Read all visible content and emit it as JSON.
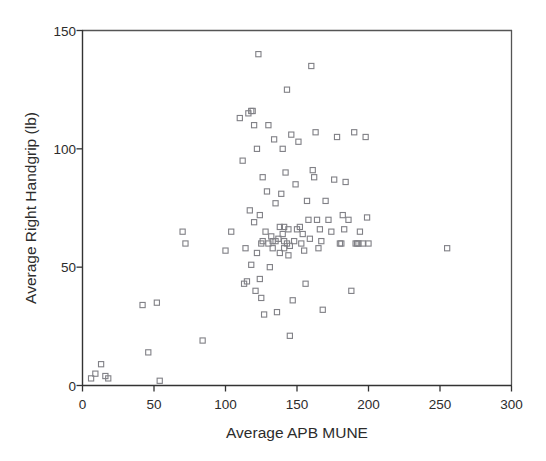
{
  "chart_data": {
    "type": "scatter",
    "title": "",
    "xlabel": "Average APB MUNE",
    "ylabel": "Average Right Handgrip (lb)",
    "xlim": [
      0,
      300
    ],
    "ylim": [
      0,
      150
    ],
    "xticks": [
      0,
      50,
      100,
      150,
      200,
      250,
      300
    ],
    "yticks": [
      0,
      50,
      100,
      150
    ],
    "grid": false,
    "legend": null,
    "marker": "open-square",
    "marker_color": "#808086",
    "n_points": 110,
    "points": [
      [
        6,
        3
      ],
      [
        9,
        5
      ],
      [
        13,
        9
      ],
      [
        16,
        4
      ],
      [
        18,
        3
      ],
      [
        42,
        34
      ],
      [
        46,
        14
      ],
      [
        52,
        35
      ],
      [
        54,
        2
      ],
      [
        70,
        65
      ],
      [
        72,
        60
      ],
      [
        84,
        19
      ],
      [
        100,
        57
      ],
      [
        104,
        65
      ],
      [
        110,
        113
      ],
      [
        112,
        95
      ],
      [
        113,
        43
      ],
      [
        114,
        58
      ],
      [
        115,
        44
      ],
      [
        116,
        115
      ],
      [
        117,
        74
      ],
      [
        118,
        116
      ],
      [
        119,
        116
      ],
      [
        120,
        69
      ],
      [
        121,
        40
      ],
      [
        122,
        56
      ],
      [
        122,
        100
      ],
      [
        123,
        140
      ],
      [
        124,
        72
      ],
      [
        124,
        45
      ],
      [
        125,
        37
      ],
      [
        126,
        88
      ],
      [
        126,
        61
      ],
      [
        127,
        30
      ],
      [
        128,
        65
      ],
      [
        129,
        82
      ],
      [
        130,
        110
      ],
      [
        131,
        50
      ],
      [
        132,
        63
      ],
      [
        133,
        58
      ],
      [
        134,
        104
      ],
      [
        135,
        77
      ],
      [
        135,
        61
      ],
      [
        136,
        31
      ],
      [
        137,
        62
      ],
      [
        138,
        56
      ],
      [
        138,
        67
      ],
      [
        139,
        81
      ],
      [
        140,
        100
      ],
      [
        140,
        64
      ],
      [
        141,
        67
      ],
      [
        141,
        61
      ],
      [
        142,
        90
      ],
      [
        143,
        125
      ],
      [
        144,
        66
      ],
      [
        144,
        55
      ],
      [
        145,
        21
      ],
      [
        146,
        106
      ],
      [
        147,
        36
      ],
      [
        148,
        61
      ],
      [
        149,
        85
      ],
      [
        150,
        66
      ],
      [
        151,
        103
      ],
      [
        152,
        67
      ],
      [
        153,
        60
      ],
      [
        154,
        64
      ],
      [
        155,
        57
      ],
      [
        156,
        43
      ],
      [
        157,
        78
      ],
      [
        158,
        70
      ],
      [
        159,
        62
      ],
      [
        160,
        135
      ],
      [
        161,
        91
      ],
      [
        162,
        88
      ],
      [
        163,
        107
      ],
      [
        164,
        70
      ],
      [
        165,
        58
      ],
      [
        166,
        66
      ],
      [
        167,
        61
      ],
      [
        168,
        32
      ],
      [
        170,
        78
      ],
      [
        172,
        70
      ],
      [
        174,
        65
      ],
      [
        176,
        87
      ],
      [
        178,
        105
      ],
      [
        180,
        60
      ],
      [
        181,
        60
      ],
      [
        182,
        72
      ],
      [
        183,
        66
      ],
      [
        184,
        86
      ],
      [
        186,
        70
      ],
      [
        188,
        40
      ],
      [
        190,
        107
      ],
      [
        191,
        60
      ],
      [
        192,
        60
      ],
      [
        193,
        60
      ],
      [
        194,
        65
      ],
      [
        196,
        60
      ],
      [
        198,
        105
      ],
      [
        199,
        71
      ],
      [
        200,
        60
      ],
      [
        255,
        58
      ],
      [
        120,
        110
      ],
      [
        125,
        60
      ],
      [
        130,
        60
      ],
      [
        133,
        61
      ],
      [
        141,
        58
      ],
      [
        143,
        60
      ],
      [
        145,
        59
      ],
      [
        118,
        51
      ]
    ]
  },
  "axes": {
    "x_tick_labels": [
      "0",
      "50",
      "100",
      "150",
      "200",
      "250",
      "300"
    ],
    "y_tick_labels": [
      "0",
      "50",
      "100",
      "150"
    ]
  }
}
